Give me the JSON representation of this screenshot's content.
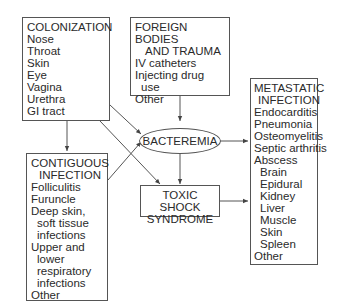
{
  "nodes": {
    "colonization": {
      "title": "COLONIZATION",
      "items": [
        "Nose",
        "Throat",
        "Skin",
        "Eye",
        "Vagina",
        "Urethra",
        "GI tract"
      ]
    },
    "foreign_bodies": {
      "title_line1": "FOREIGN BODIES",
      "title_line2": "AND TRAUMA",
      "items": [
        "IV catheters",
        "Injecting drug",
        "use",
        "Other"
      ]
    },
    "contiguous": {
      "title_line1": "CONTIGUOUS",
      "title_line2": "INFECTION",
      "items": [
        "Folliculitis",
        "Furuncle",
        "Deep skin,",
        "soft tissue",
        "infections",
        "Upper and",
        "lower",
        "respiratory",
        "infections",
        "Other"
      ]
    },
    "bacteremia": {
      "label": "BACTEREMIA"
    },
    "toxic_shock": {
      "line1": "TOXIC SHOCK",
      "line2": "SYNDROME"
    },
    "metastatic": {
      "title_line1": "METASTATIC",
      "title_line2": "INFECTION",
      "items": [
        "Endocarditis",
        "Pneumonia",
        "Osteomyelitis",
        "Septic arthritis",
        "Abscess"
      ],
      "abscess_sites": [
        "Brain",
        "Epidural",
        "Kidney",
        "Liver",
        "Muscle",
        "Skin",
        "Spleen"
      ],
      "other": "Other"
    }
  },
  "edges": [
    {
      "from": "colonization",
      "to": "contiguous"
    },
    {
      "from": "colonization",
      "to": "bacteremia"
    },
    {
      "from": "colonization",
      "to": "toxic_shock"
    },
    {
      "from": "foreign_bodies",
      "to": "bacteremia"
    },
    {
      "from": "contiguous",
      "to": "bacteremia"
    },
    {
      "from": "bacteremia",
      "to": "metastatic"
    },
    {
      "from": "bacteremia",
      "to": "toxic_shock"
    },
    {
      "from": "toxic_shock",
      "to": "metastatic"
    }
  ]
}
